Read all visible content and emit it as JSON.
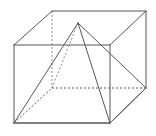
{
  "figure": {
    "type": "line-drawing",
    "projection": "oblique",
    "canvas": {
      "width": 156,
      "height": 136,
      "background": "#ffffff"
    },
    "colors": {
      "visible_edge": "#55565a",
      "hidden_edge": "#8d8e92",
      "background": "#ffffff"
    },
    "stroke": {
      "visible_width": 1,
      "hidden_width": 1,
      "hidden_dash": "2 2"
    },
    "vertices": {
      "front_top_left": {
        "label": "front-top-left",
        "x": 14,
        "y": 45
      },
      "front_top_right": {
        "label": "front-top-right",
        "x": 110,
        "y": 45
      },
      "front_bottom_right": {
        "label": "front-bottom-right",
        "x": 110,
        "y": 123
      },
      "front_bottom_left": {
        "label": "front-bottom-left",
        "x": 14,
        "y": 123
      },
      "back_top_left": {
        "label": "back-top-left",
        "x": 52,
        "y": 11
      },
      "back_top_right": {
        "label": "back-top-right",
        "x": 146,
        "y": 11
      },
      "back_bottom_right": {
        "label": "back-bottom-right",
        "x": 146,
        "y": 88
      },
      "back_bottom_left": {
        "label": "back-bottom-left",
        "x": 52,
        "y": 88
      },
      "apex": {
        "label": "pyramid-apex",
        "x": 78,
        "y": 23
      }
    },
    "prism_edges_visible": [
      {
        "name": "front-face-top",
        "d": "M 14 45 L 110 45"
      },
      {
        "name": "front-face-right",
        "d": "M 110 45 L 110 123"
      },
      {
        "name": "front-face-bottom",
        "d": "M 14 123 L 110 123"
      },
      {
        "name": "front-face-left",
        "d": "M 14 45 L 14 123"
      },
      {
        "name": "top-face-back",
        "d": "M 52 11 L 146 11"
      },
      {
        "name": "right-face-back",
        "d": "M 146 11 L 146 88"
      },
      {
        "name": "top-left-diagonal",
        "d": "M 14 45 L 52 11"
      },
      {
        "name": "top-right-diagonal",
        "d": "M 110 45 L 146 11"
      },
      {
        "name": "bottom-right-diagonal",
        "d": "M 110 123 L 146 88"
      }
    ],
    "prism_edges_hidden": [
      {
        "name": "back-vertical-left",
        "d": "M 52 11 L 52 88"
      },
      {
        "name": "bottom-face-back",
        "d": "M 52 88 L 146 88"
      },
      {
        "name": "bottom-left-diagonal",
        "d": "M 14 123 L 52 88"
      }
    ],
    "pyramid_edges_visible": [
      {
        "name": "apex-to-front-bottom-left",
        "d": "M 78 23 L 14 123"
      },
      {
        "name": "apex-to-front-bottom-right",
        "d": "M 78 23 L 110 123"
      },
      {
        "name": "apex-to-back-bottom-right",
        "d": "M 78 23 L 146 88"
      },
      {
        "name": "base-front-bottom-edge",
        "d": "M 14 123 L 110 123"
      },
      {
        "name": "base-right-bottom-edge",
        "d": "M 110 123 L 146 88"
      }
    ],
    "pyramid_edges_hidden": [
      {
        "name": "apex-to-back-bottom-left",
        "d": "M 78 23 L 52 88"
      },
      {
        "name": "base-back-left-edge",
        "d": "M 14 123 L 52 88"
      },
      {
        "name": "base-back-edge",
        "d": "M 52 88 L 146 88"
      }
    ]
  }
}
